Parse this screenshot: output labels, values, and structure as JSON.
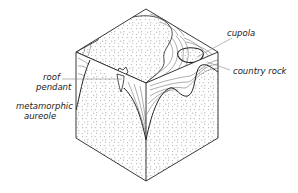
{
  "figure": {
    "labels": {
      "cupola": "cupola",
      "country_rock": "country rock",
      "roof_pendant_line1": "roof",
      "roof_pendant_line2": "pendant",
      "aureole_line1": "metamorphic",
      "aureole_line2": "aureole"
    },
    "colors": {
      "line": "#222222",
      "background": "#ffffff",
      "leader": "#888888"
    }
  }
}
